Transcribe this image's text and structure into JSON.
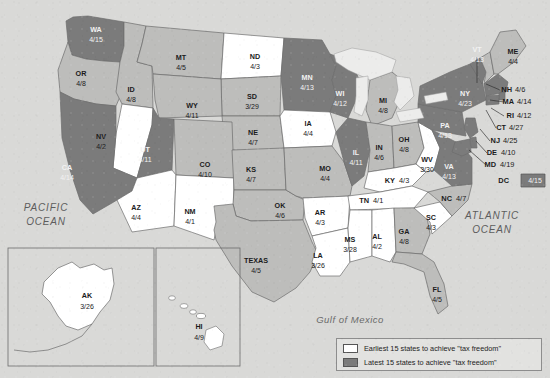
{
  "colors": {
    "background": "#d9d9d7",
    "early_fill": "#ffffff",
    "late_fill": "#7b7b7b",
    "middle_fill": "#bdbdbb",
    "lake_fill": "#ececeb",
    "border": "#6d6d6d",
    "text_dark": "#1b1b1b",
    "text_light": "#f2f2f2"
  },
  "ocean_labels": [
    {
      "name": "pacific-ocean",
      "line1": "PACIFIC",
      "line2": "OCEAN",
      "x": 46,
      "y": 208
    },
    {
      "name": "atlantic-ocean",
      "line1": "ATLANTIC",
      "line2": "OCEAN",
      "x": 492,
      "y": 216
    },
    {
      "name": "gulf-of-mexico",
      "line1": "Gulf of Mexico",
      "line2": "",
      "x": 350,
      "y": 320
    }
  ],
  "legend": {
    "title": "",
    "rows": [
      {
        "swatch": "early",
        "label": "Earliest 15 states to achieve \"tax freedom\""
      },
      {
        "swatch": "late",
        "label": "Latest 15 states to achieve \"tax freedom\""
      }
    ]
  },
  "states": [
    {
      "code": "WA",
      "value": "4/15",
      "group": "late",
      "lx": 96,
      "ly": 30,
      "vy": 40
    },
    {
      "code": "OR",
      "value": "4/8",
      "group": "middle",
      "lx": 81,
      "ly": 74,
      "vy": 84
    },
    {
      "code": "ID",
      "value": "4/8",
      "group": "middle",
      "lx": 131,
      "ly": 90,
      "vy": 100
    },
    {
      "code": "MT",
      "value": "4/5",
      "group": "middle",
      "lx": 181,
      "ly": 58,
      "vy": 68
    },
    {
      "code": "ND",
      "value": "4/3",
      "group": "early",
      "lx": 255,
      "ly": 57,
      "vy": 67
    },
    {
      "code": "SD",
      "value": "3/29",
      "group": "middle",
      "lx": 252,
      "ly": 97,
      "vy": 107
    },
    {
      "code": "WY",
      "value": "4/11",
      "group": "middle",
      "lx": 192,
      "ly": 106,
      "vy": 116
    },
    {
      "code": "NV",
      "value": "4/2",
      "group": "early",
      "lx": 101,
      "ly": 137,
      "vy": 147
    },
    {
      "code": "UT",
      "value": "4/11",
      "group": "late",
      "lx": 145,
      "ly": 150,
      "vy": 160
    },
    {
      "code": "CO",
      "value": "4/10",
      "group": "middle",
      "lx": 205,
      "ly": 165,
      "vy": 175
    },
    {
      "code": "NE",
      "value": "4/7",
      "group": "middle",
      "lx": 253,
      "ly": 133,
      "vy": 143
    },
    {
      "code": "KS",
      "value": "4/7",
      "group": "middle",
      "lx": 251,
      "ly": 170,
      "vy": 180
    },
    {
      "code": "CA",
      "value": "4/14",
      "group": "late",
      "lx": 67,
      "ly": 168,
      "vy": 178
    },
    {
      "code": "AZ",
      "value": "4/4",
      "group": "early",
      "lx": 136,
      "ly": 208,
      "vy": 218
    },
    {
      "code": "NM",
      "value": "4/1",
      "group": "early",
      "lx": 190,
      "ly": 212,
      "vy": 222
    },
    {
      "code": "TEXAS",
      "value": "4/5",
      "group": "middle",
      "lx": 256,
      "ly": 261,
      "vy": 271
    },
    {
      "code": "OK",
      "value": "4/6",
      "group": "middle",
      "lx": 280,
      "ly": 206,
      "vy": 216
    },
    {
      "code": "MN",
      "value": "4/13",
      "group": "late",
      "lx": 307,
      "ly": 78,
      "vy": 88
    },
    {
      "code": "IA",
      "value": "4/4",
      "group": "early",
      "lx": 308,
      "ly": 124,
      "vy": 134
    },
    {
      "code": "MO",
      "value": "4/4",
      "group": "middle",
      "lx": 325,
      "ly": 169,
      "vy": 179
    },
    {
      "code": "AR",
      "value": "4/3",
      "group": "early",
      "lx": 320,
      "ly": 213,
      "vy": 223
    },
    {
      "code": "LA",
      "value": "3/26",
      "group": "early",
      "lx": 318,
      "ly": 256,
      "vy": 266
    },
    {
      "code": "WI",
      "value": "4/12",
      "group": "late",
      "lx": 340,
      "ly": 94,
      "vy": 104
    },
    {
      "code": "IL",
      "value": "4/11",
      "group": "late",
      "lx": 356,
      "ly": 153,
      "vy": 163
    },
    {
      "code": "MI",
      "value": "4/8",
      "group": "middle",
      "lx": 383,
      "ly": 101,
      "vy": 111
    },
    {
      "code": "IN",
      "value": "4/6",
      "group": "middle",
      "lx": 379,
      "ly": 148,
      "vy": 158
    },
    {
      "code": "OH",
      "value": "4/8",
      "group": "middle",
      "lx": 404,
      "ly": 140,
      "vy": 150
    },
    {
      "code": "MS",
      "value": "3/28",
      "group": "early",
      "lx": 350,
      "ly": 240,
      "vy": 250
    },
    {
      "code": "AL",
      "value": "4/2",
      "group": "early",
      "lx": 377,
      "ly": 237,
      "vy": 247
    },
    {
      "code": "GA",
      "value": "4/8",
      "group": "middle",
      "lx": 404,
      "ly": 232,
      "vy": 242
    },
    {
      "code": "SC",
      "value": "4/3",
      "group": "early",
      "lx": 431,
      "ly": 218,
      "vy": 228
    },
    {
      "code": "FL",
      "value": "4/5",
      "group": "middle",
      "lx": 437,
      "ly": 290,
      "vy": 300
    },
    {
      "code": "PA",
      "value": "4/13",
      "group": "late",
      "lx": 445,
      "ly": 126,
      "vy": 136
    },
    {
      "code": "NY",
      "value": "4/23",
      "group": "late",
      "lx": 465,
      "ly": 94,
      "vy": 104
    },
    {
      "code": "VA",
      "value": "4/13",
      "group": "late",
      "lx": 449,
      "ly": 167,
      "vy": 177
    },
    {
      "code": "WV",
      "value": "3/30",
      "group": "early",
      "lx": 427,
      "ly": 160,
      "vy": 170
    },
    {
      "code": "VT",
      "value": "4/13",
      "group": "late",
      "lx": 477,
      "ly": 50,
      "vy": 60
    },
    {
      "code": "ME",
      "value": "4/4",
      "group": "middle",
      "lx": 513,
      "ly": 52,
      "vy": 62
    },
    {
      "code": "AK",
      "value": "3/26",
      "group": "early",
      "lx": 87,
      "ly": 296,
      "vy": 307
    },
    {
      "code": "HI",
      "value": "4/9",
      "group": "early",
      "lx": 199,
      "ly": 327,
      "vy": 338
    }
  ],
  "side_states": [
    {
      "code": "NH",
      "value": "4/6",
      "lx": 512,
      "vx": 515,
      "y": 90
    },
    {
      "code": "MA",
      "value": "4/14",
      "lx": 514,
      "vx": 517,
      "y": 102
    },
    {
      "code": "RI",
      "value": "4/12",
      "lx": 514,
      "vx": 517,
      "y": 116
    },
    {
      "code": "CT",
      "value": "4/27",
      "lx": 506,
      "vx": 509,
      "y": 128
    },
    {
      "code": "NJ",
      "value": "4/25",
      "lx": 500,
      "vx": 503,
      "y": 141
    },
    {
      "code": "DE",
      "value": "4/10",
      "lx": 497,
      "vx": 501,
      "y": 153
    },
    {
      "code": "MD",
      "value": "4/19",
      "lx": 496,
      "vx": 500,
      "y": 165
    },
    {
      "code": "KY",
      "value": "4/3",
      "lx": 395,
      "vx": 399,
      "y": 181
    },
    {
      "code": "TN",
      "value": "4/1",
      "lx": 369,
      "vx": 373,
      "y": 201
    },
    {
      "code": "NC",
      "value": "4/7",
      "lx": 452,
      "vx": 456,
      "y": 199
    }
  ],
  "dc": {
    "code": "DC",
    "value": "4/15",
    "group": "late",
    "lx": 509,
    "ly": 181,
    "vx": 535
  },
  "leader_lines": [
    {
      "name": "vt-leader",
      "x1": 477,
      "y1": 57,
      "x2": 477,
      "y2": 83
    },
    {
      "name": "nh-leader",
      "x1": 500,
      "y1": 90,
      "x2": 486,
      "y2": 84
    },
    {
      "name": "ma-leader",
      "x1": 504,
      "y1": 102,
      "x2": 490,
      "y2": 100
    },
    {
      "name": "ri-leader",
      "x1": 504,
      "y1": 116,
      "x2": 491,
      "y2": 108
    },
    {
      "name": "ct-leader",
      "x1": 496,
      "y1": 128,
      "x2": 486,
      "y2": 110
    },
    {
      "name": "nj-leader",
      "x1": 490,
      "y1": 141,
      "x2": 480,
      "y2": 129
    },
    {
      "name": "de-leader",
      "x1": 487,
      "y1": 153,
      "x2": 476,
      "y2": 141
    },
    {
      "name": "md-leader",
      "x1": 486,
      "y1": 165,
      "x2": 469,
      "y2": 150
    }
  ]
}
